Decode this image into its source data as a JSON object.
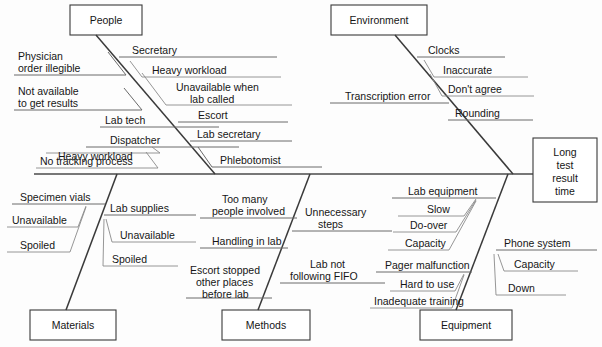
{
  "diagram": {
    "type": "fishbone-ishikawa",
    "effect": {
      "label_lines": [
        "Long",
        "test",
        "result",
        "time"
      ],
      "full_label": "Long test result time"
    },
    "categories": [
      {
        "name": "People",
        "label": "People",
        "position": "top-left",
        "causes": [
          {
            "label": "Physician order illegible",
            "lines": [
              "Physician",
              "order illegible"
            ],
            "side": "left"
          },
          {
            "label": "Not available to get results",
            "lines": [
              "Not available",
              "to get results"
            ],
            "side": "left"
          },
          {
            "label": "Secretary",
            "lines": [
              "Secretary"
            ],
            "side": "right",
            "subcauses": [
              {
                "label": "Heavy workload",
                "lines": [
                  "Heavy workload"
                ]
              },
              {
                "label": "Unavailable when lab called",
                "lines": [
                  "Unavailable when",
                  "lab called"
                ]
              }
            ]
          },
          {
            "label": "Lab tech",
            "lines": [
              "Lab tech"
            ],
            "side": "left"
          },
          {
            "label": "Dispatcher",
            "lines": [
              "Dispatcher"
            ],
            "side": "left",
            "subcauses": [
              {
                "label": "Heavy workload",
                "lines": [
                  "Heavy workload"
                ]
              },
              {
                "label": "No tracking process",
                "lines": [
                  "No tracking process"
                ]
              }
            ]
          },
          {
            "label": "Escort",
            "lines": [
              "Escort"
            ],
            "side": "right"
          },
          {
            "label": "Lab secretary",
            "lines": [
              "Lab secretary"
            ],
            "side": "right"
          },
          {
            "label": "Phlebotomist",
            "lines": [
              "Phlebotomist"
            ],
            "side": "right"
          }
        ]
      },
      {
        "name": "Environment",
        "label": "Environment",
        "position": "top-right",
        "causes": [
          {
            "label": "Clocks",
            "lines": [
              "Clocks"
            ],
            "side": "right",
            "subcauses": [
              {
                "label": "Inaccurate",
                "lines": [
                  "Inaccurate"
                ]
              },
              {
                "label": "Don't agree",
                "lines": [
                  "Don't agree"
                ]
              }
            ]
          },
          {
            "label": "Transcription error",
            "lines": [
              "Transcription error"
            ],
            "side": "left"
          },
          {
            "label": "Rounding",
            "lines": [
              "Rounding"
            ],
            "side": "right"
          }
        ]
      },
      {
        "name": "Materials",
        "label": "Materials",
        "position": "bottom-left",
        "causes": [
          {
            "label": "Specimen vials",
            "lines": [
              "Specimen vials"
            ],
            "side": "left",
            "subcauses": [
              {
                "label": "Unavailable",
                "lines": [
                  "Unavailable"
                ]
              },
              {
                "label": "Spoiled",
                "lines": [
                  "Spoiled"
                ]
              }
            ]
          },
          {
            "label": "Lab supplies",
            "lines": [
              "Lab supplies"
            ],
            "side": "right",
            "subcauses": [
              {
                "label": "Unavailable",
                "lines": [
                  "Unavailable"
                ]
              },
              {
                "label": "Spoiled",
                "lines": [
                  "Spoiled"
                ]
              }
            ]
          }
        ]
      },
      {
        "name": "Methods",
        "label": "Methods",
        "position": "bottom-center",
        "causes": [
          {
            "label": "Too many people involved",
            "lines": [
              "Too many",
              "people involved"
            ],
            "side": "left"
          },
          {
            "label": "Handling in lab",
            "lines": [
              "Handling in lab"
            ],
            "side": "left"
          },
          {
            "label": "Escort stopped other places before lab",
            "lines": [
              "Escort stopped",
              "other places",
              "before lab"
            ],
            "side": "left"
          },
          {
            "label": "Unnecessary steps",
            "lines": [
              "Unnecessary",
              "steps"
            ],
            "side": "right"
          },
          {
            "label": "Lab not following FIFO",
            "lines": [
              "Lab not",
              "following FIFO"
            ],
            "side": "right"
          }
        ]
      },
      {
        "name": "Equipment",
        "label": "Equipment",
        "position": "bottom-right",
        "causes": [
          {
            "label": "Lab equipment",
            "lines": [
              "Lab equipment"
            ],
            "side": "left",
            "subcauses": [
              {
                "label": "Slow",
                "lines": [
                  "Slow"
                ]
              },
              {
                "label": "Do-over",
                "lines": [
                  "Do-over"
                ]
              },
              {
                "label": "Capacity",
                "lines": [
                  "Capacity"
                ]
              }
            ]
          },
          {
            "label": "Pager malfunction",
            "lines": [
              "Pager malfunction"
            ],
            "side": "left",
            "subcauses": [
              {
                "label": "Hard to use",
                "lines": [
                  "Hard to use"
                ]
              },
              {
                "label": "Inadequate training",
                "lines": [
                  "Inadequate training"
                ]
              }
            ]
          },
          {
            "label": "Phone system",
            "lines": [
              "Phone system"
            ],
            "side": "right",
            "subcauses": [
              {
                "label": "Capacity",
                "lines": [
                  "Capacity"
                ]
              },
              {
                "label": "Down",
                "lines": [
                  "Down"
                ]
              }
            ]
          }
        ]
      }
    ]
  },
  "labels": {
    "people": "People",
    "environment": "Environment",
    "materials": "Materials",
    "methods": "Methods",
    "equipment": "Equipment",
    "effect_l1": "Long",
    "effect_l2": "test",
    "effect_l3": "result",
    "effect_l4": "time",
    "physician_1": "Physician",
    "physician_2": "order illegible",
    "notavail_1": "Not available",
    "notavail_2": "to get results",
    "secretary": "Secretary",
    "heavy_workload_sec": "Heavy workload",
    "unavail_lab_1": "Unavailable when",
    "unavail_lab_2": "lab called",
    "lab_tech": "Lab tech",
    "dispatcher": "Dispatcher",
    "heavy_workload_disp": "Heavy workload",
    "no_tracking": "No tracking process",
    "escort": "Escort",
    "lab_secretary": "Lab secretary",
    "phlebotomist": "Phlebotomist",
    "clocks": "Clocks",
    "inaccurate": "Inaccurate",
    "dont_agree": "Don't agree",
    "transcription_error": "Transcription error",
    "rounding": "Rounding",
    "specimen_vials": "Specimen vials",
    "unavailable_sv": "Unavailable",
    "spoiled_sv": "Spoiled",
    "lab_supplies": "Lab supplies",
    "unavailable_ls": "Unavailable",
    "spoiled_ls": "Spoiled",
    "too_many_1": "Too many",
    "too_many_2": "people involved",
    "handling_in_lab": "Handling in lab",
    "escort_stopped_1": "Escort stopped",
    "escort_stopped_2": "other places",
    "escort_stopped_3": "before lab",
    "unnecessary_1": "Unnecessary",
    "unnecessary_2": "steps",
    "lab_not_fifo_1": "Lab not",
    "lab_not_fifo_2": "following FIFO",
    "lab_equipment": "Lab equipment",
    "slow": "Slow",
    "do_over": "Do-over",
    "capacity_le": "Capacity",
    "pager_malfunction": "Pager malfunction",
    "hard_to_use": "Hard to use",
    "inadequate_training": "Inadequate training",
    "phone_system": "Phone system",
    "capacity_ps": "Capacity",
    "down": "Down"
  },
  "colors": {
    "background": "#fdfdfd",
    "box_stroke": "#3a3a3a",
    "spine": "#4a4a4a",
    "bone": "#3a3a3a",
    "twig": "#6a6a6a",
    "text": "#161616"
  }
}
